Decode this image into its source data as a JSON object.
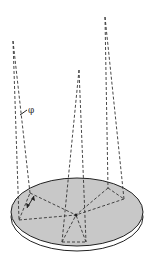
{
  "diagram": {
    "type": "3d-geometry-schematic",
    "labels": {
      "angle": "φ"
    },
    "colors": {
      "disc_fill": "#c8c8c8",
      "rim_fill": "#ffffff",
      "line": "#333333",
      "background": "#ffffff"
    },
    "disc": {
      "cx": 77,
      "cy": 212,
      "rx": 66,
      "ry": 34,
      "rim_offset": 5
    },
    "cones": [
      {
        "name": "left",
        "apex": [
          13,
          41
        ],
        "base_left": [
          19,
          220
        ],
        "base_right": [
          30,
          193
        ]
      },
      {
        "name": "middle",
        "apex": [
          79,
          70
        ],
        "base_left": [
          62,
          242
        ],
        "base_right": [
          86,
          242
        ]
      },
      {
        "name": "right",
        "apex": [
          105,
          17
        ],
        "base_left": [
          108,
          188
        ],
        "base_right": [
          124,
          199
        ]
      }
    ],
    "center_point": [
      76,
      215
    ]
  }
}
